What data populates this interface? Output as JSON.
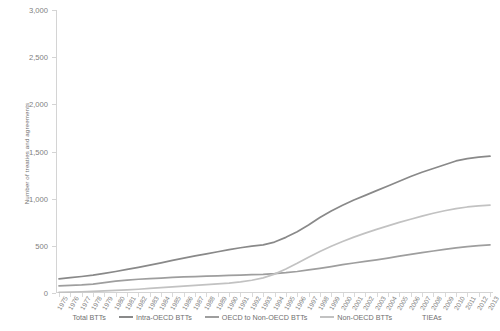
{
  "chart_data": {
    "type": "line",
    "title": "",
    "xlabel": "",
    "ylabel": "Number of treaties and agreements",
    "ylim": [
      0,
      3000
    ],
    "ytick_labels": [
      "0",
      "500",
      "1,000",
      "1,500",
      "2,000",
      "2,500",
      "3,000"
    ],
    "ytick_values": [
      0,
      500,
      1000,
      1500,
      2000,
      2500,
      3000
    ],
    "grid": false,
    "legend_position": "bottom",
    "x": [
      1975,
      1976,
      1977,
      1978,
      1979,
      1980,
      1981,
      1982,
      1983,
      1984,
      1985,
      1986,
      1987,
      1988,
      1989,
      1990,
      1991,
      1992,
      1993,
      1994,
      1995,
      1996,
      1997,
      1998,
      1999,
      2000,
      2001,
      2002,
      2003,
      2004,
      2005,
      2006,
      2007,
      2008,
      2009,
      2010,
      2011,
      2012,
      2013
    ],
    "categories": [
      "1975",
      "1976",
      "1977",
      "1978",
      "1979",
      "1980",
      "1981",
      "1982",
      "1983",
      "1984",
      "1985",
      "1986",
      "1987",
      "1988",
      "1989",
      "1990",
      "1991",
      "1992",
      "1993",
      "1994",
      "1995",
      "1996",
      "1997",
      "1998",
      "1999",
      "2000",
      "2001",
      "2002",
      "2003",
      "2004",
      "2005",
      "2006",
      "2007",
      "2008",
      "2009",
      "2010",
      "2011",
      "2012",
      "2013"
    ],
    "series": [
      {
        "name": "Total BTTs",
        "color": "#ffffff",
        "values": [
          null,
          null,
          null,
          null,
          null,
          null,
          null,
          null,
          null,
          null,
          null,
          null,
          null,
          null,
          null,
          null,
          null,
          null,
          null,
          null,
          null,
          null,
          null,
          null,
          null,
          null,
          null,
          null,
          null,
          null,
          null,
          null,
          null,
          null,
          null,
          null,
          null,
          null,
          null
        ]
      },
      {
        "name": "Intra-OECD BTTs",
        "color": "#898989",
        "values": [
          150,
          162,
          175,
          190,
          208,
          228,
          250,
          272,
          295,
          320,
          345,
          370,
          393,
          415,
          437,
          460,
          480,
          497,
          510,
          540,
          590,
          650,
          720,
          800,
          870,
          930,
          985,
          1035,
          1085,
          1135,
          1185,
          1235,
          1280,
          1320,
          1360,
          1400,
          1425,
          1440,
          1450
        ]
      },
      {
        "name": "OECD to Non-OECD BTTs",
        "color": "#9e9e9e",
        "values": [
          75,
          80,
          86,
          95,
          110,
          125,
          136,
          146,
          152,
          158,
          165,
          170,
          174,
          178,
          182,
          186,
          190,
          194,
          198,
          205,
          215,
          228,
          245,
          262,
          280,
          300,
          318,
          335,
          352,
          370,
          390,
          410,
          428,
          445,
          462,
          478,
          492,
          503,
          510
        ]
      },
      {
        "name": "Non-OECD BTTs",
        "color": "#c2c2c2",
        "values": [
          8,
          10,
          13,
          17,
          22,
          28,
          34,
          40,
          48,
          56,
          64,
          72,
          80,
          88,
          96,
          105,
          118,
          135,
          160,
          200,
          255,
          315,
          380,
          440,
          495,
          545,
          592,
          635,
          675,
          712,
          748,
          782,
          815,
          845,
          872,
          895,
          912,
          924,
          932
        ]
      },
      {
        "name": "TIEAs",
        "color": "#ffffff",
        "values": [
          null,
          null,
          null,
          null,
          null,
          null,
          null,
          null,
          null,
          null,
          null,
          null,
          null,
          null,
          null,
          null,
          null,
          null,
          null,
          null,
          null,
          null,
          null,
          null,
          null,
          null,
          null,
          null,
          null,
          null,
          null,
          null,
          null,
          null,
          null,
          null,
          null,
          null,
          null
        ]
      }
    ]
  },
  "legend": {
    "items": [
      {
        "label": "Total BTTs",
        "color": "#ffffff"
      },
      {
        "label": "Intra-OECD BTTs",
        "color": "#898989"
      },
      {
        "label": "OECD to Non-OECD BTTs",
        "color": "#9e9e9e"
      },
      {
        "label": "Non-OECD BTTs",
        "color": "#c2c2c2"
      },
      {
        "label": "TIEAs",
        "color": "#ffffff"
      }
    ]
  },
  "axis": {
    "y_title": "Number of treaties and agreements"
  },
  "colors": {
    "axis_line": "#d4d4d4",
    "tick_text": "#808080",
    "background": "#ffffff"
  }
}
